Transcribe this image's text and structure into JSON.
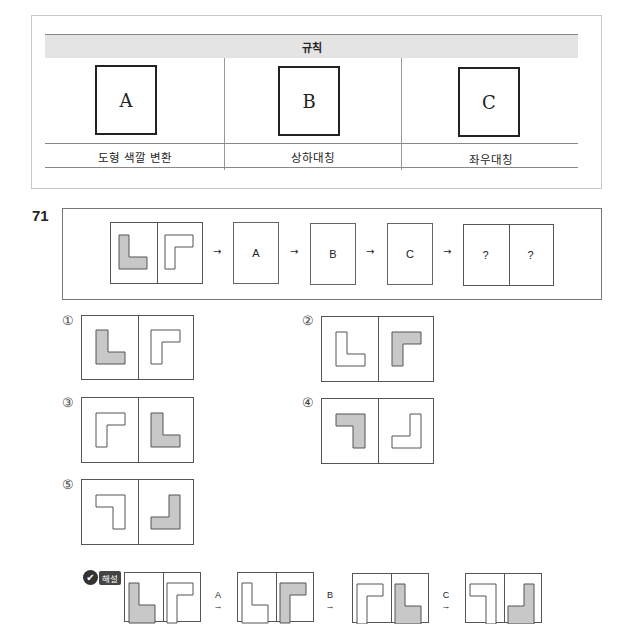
{
  "rules": {
    "title": "규칙",
    "items": [
      {
        "key": "A",
        "label": "도형 색깔 변환"
      },
      {
        "key": "B",
        "label": "상하대칭"
      },
      {
        "key": "C",
        "label": "좌우대칭"
      }
    ]
  },
  "question": {
    "number": "71",
    "sequence": [
      "A",
      "B",
      "C"
    ],
    "unknown": [
      "?",
      "?"
    ],
    "arrow": "→"
  },
  "options": [
    {
      "num": "①",
      "left": {
        "shape": "L",
        "fill": "gray"
      },
      "right": {
        "shape": "Γ",
        "fill": "white"
      }
    },
    {
      "num": "②",
      "left": {
        "shape": "L",
        "fill": "white"
      },
      "right": {
        "shape": "Γ",
        "fill": "gray"
      }
    },
    {
      "num": "③",
      "left": {
        "shape": "Γ",
        "fill": "white"
      },
      "right": {
        "shape": "L",
        "fill": "gray"
      }
    },
    {
      "num": "④",
      "left": {
        "shape": "ㄱ",
        "fill": "gray"
      },
      "right": {
        "shape": "J",
        "fill": "white"
      }
    },
    {
      "num": "⑤",
      "left": {
        "shape": "ㄱ",
        "fill": "white"
      },
      "right": {
        "shape": "J",
        "fill": "gray"
      }
    }
  ],
  "solution": {
    "badge_label": "해설",
    "badge_icon": "check-icon",
    "steps": [
      "A",
      "B",
      "C"
    ],
    "arrow": "→"
  },
  "colors": {
    "shape_fill": "#c8c8c8",
    "border": "#555555",
    "header_bg": "#e4e4e4"
  }
}
